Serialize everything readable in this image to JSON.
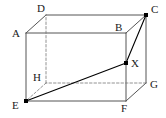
{
  "figure": {
    "kind": "cuboid-diagram",
    "background_color": "#ffffff",
    "line_color": "#555555",
    "hidden_line_color": "#777777",
    "marker_color": "#000000",
    "label_color": "#1a1a1a",
    "canvas": {
      "width": 166,
      "height": 118
    }
  },
  "vertices": [
    {
      "id": "A",
      "label": "A",
      "x": 26,
      "y": 33,
      "label_x": 12,
      "label_y": 28,
      "marked": false,
      "hidden": false
    },
    {
      "id": "B",
      "label": "B",
      "x": 126,
      "y": 33,
      "label_x": 115,
      "label_y": 22,
      "marked": false,
      "hidden": false
    },
    {
      "id": "C",
      "label": "C",
      "x": 146,
      "y": 15,
      "label_x": 151,
      "label_y": 4,
      "marked": true,
      "hidden": false
    },
    {
      "id": "D",
      "label": "D",
      "x": 46,
      "y": 15,
      "label_x": 37,
      "label_y": 3,
      "marked": false,
      "hidden": false
    },
    {
      "id": "E",
      "label": "E",
      "x": 26,
      "y": 101,
      "label_x": 12,
      "label_y": 100,
      "marked": true,
      "hidden": false
    },
    {
      "id": "F",
      "label": "F",
      "x": 126,
      "y": 101,
      "label_x": 121,
      "label_y": 103,
      "marked": false,
      "hidden": false
    },
    {
      "id": "G",
      "label": "G",
      "x": 146,
      "y": 83,
      "label_x": 150,
      "label_y": 79,
      "marked": false,
      "hidden": false
    },
    {
      "id": "H",
      "label": "H",
      "x": 46,
      "y": 83,
      "label_x": 33,
      "label_y": 72,
      "marked": false,
      "hidden": true
    },
    {
      "id": "X",
      "label": "X",
      "x": 126,
      "y": 63,
      "label_x": 131,
      "label_y": 58,
      "marked": true,
      "hidden": false
    }
  ],
  "edges": [
    {
      "id": "A-B",
      "from": "A",
      "to": "B",
      "style": "solid",
      "role": "front-top"
    },
    {
      "id": "B-F",
      "from": "B",
      "to": "F",
      "style": "solid",
      "role": "front-right"
    },
    {
      "id": "F-E",
      "from": "F",
      "to": "E",
      "style": "solid",
      "role": "front-bottom"
    },
    {
      "id": "E-A",
      "from": "E",
      "to": "A",
      "style": "solid",
      "role": "front-left"
    },
    {
      "id": "D-C",
      "from": "D",
      "to": "C",
      "style": "solid",
      "role": "back-top"
    },
    {
      "id": "C-G",
      "from": "C",
      "to": "G",
      "style": "solid",
      "role": "back-right"
    },
    {
      "id": "G-F",
      "from": "G",
      "to": "F",
      "style": "solid",
      "role": "right-bottom"
    },
    {
      "id": "A-D",
      "from": "A",
      "to": "D",
      "style": "solid",
      "role": "top-left-depth"
    },
    {
      "id": "B-C",
      "from": "B",
      "to": "C",
      "style": "solid",
      "role": "top-right-depth"
    },
    {
      "id": "G-H",
      "from": "G",
      "to": "H",
      "style": "dashed",
      "role": "hidden-back-bottom"
    },
    {
      "id": "H-D",
      "from": "H",
      "to": "D",
      "style": "dashed",
      "role": "hidden-back-left"
    },
    {
      "id": "H-E",
      "from": "H",
      "to": "E",
      "style": "dashed",
      "role": "hidden-bottom-depth"
    }
  ],
  "construction_lines": [
    {
      "id": "E-X",
      "from": "E",
      "to": "X",
      "style": "solid",
      "role": "diagonal-through-solid"
    },
    {
      "id": "X-C",
      "from": "X",
      "to": "C",
      "style": "solid",
      "role": "segment-to-corner"
    }
  ],
  "point_markers": [
    "C",
    "E",
    "X"
  ],
  "labels_order": [
    "D",
    "C",
    "A",
    "B",
    "X",
    "H",
    "G",
    "E",
    "F"
  ]
}
